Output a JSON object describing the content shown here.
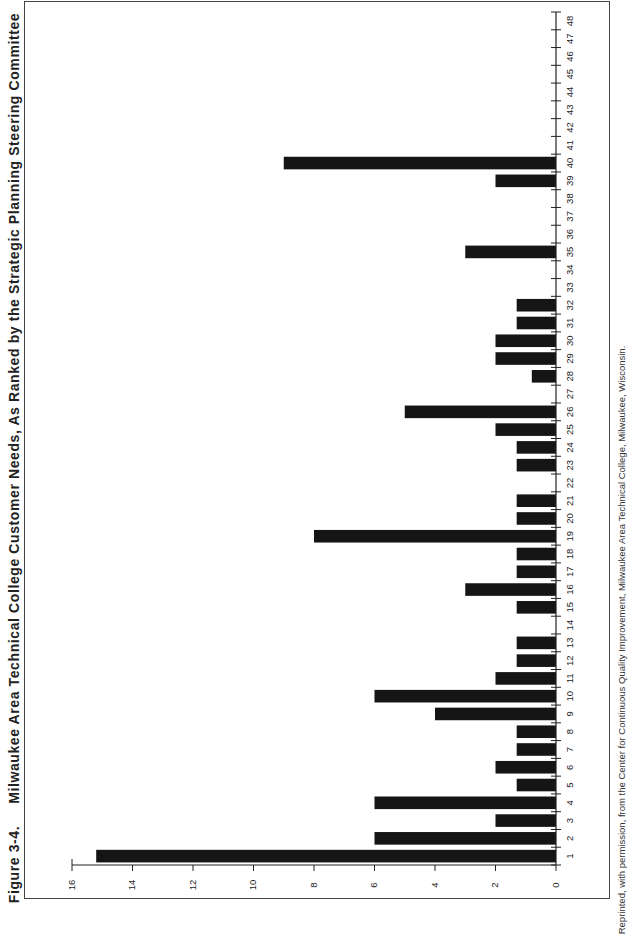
{
  "figure": {
    "label": "Figure 3-4.",
    "title": "Milwaukee Area Technical College Customer Needs, As Ranked by the Strategic Planning Steering Committee",
    "credit": "Reprinted, with permission, from the Center for Continuous Quality Improvement, Milwaukee Area Technical College, Milwaukee, Wisconsin."
  },
  "chart_data": {
    "type": "bar",
    "orientation": "horizontal-rotated page (bars extend from category axis)",
    "xlabel": "",
    "ylabel": "",
    "categories": [
      "1",
      "2",
      "3",
      "4",
      "5",
      "6",
      "7",
      "8",
      "9",
      "10",
      "11",
      "12",
      "13",
      "14",
      "15",
      "16",
      "17",
      "18",
      "19",
      "20",
      "21",
      "22",
      "23",
      "24",
      "25",
      "26",
      "27",
      "28",
      "29",
      "30",
      "31",
      "32",
      "33",
      "34",
      "35",
      "36",
      "37",
      "38",
      "39",
      "40",
      "41",
      "42",
      "43",
      "44",
      "45",
      "46",
      "47",
      "48"
    ],
    "values": [
      15.2,
      6,
      2,
      6,
      1.3,
      2,
      1.3,
      1.3,
      4,
      6,
      2,
      1.3,
      1.3,
      0,
      1.3,
      3,
      1.3,
      1.3,
      8,
      1.3,
      1.3,
      0,
      1.3,
      1.3,
      2,
      5,
      0,
      0.8,
      2,
      2,
      1.3,
      1.3,
      0,
      0,
      3,
      0,
      0,
      0,
      2,
      9,
      0,
      0,
      0,
      0,
      0,
      0,
      0,
      0
    ],
    "value_ticks": [
      0,
      2,
      4,
      6,
      8,
      10,
      12,
      14,
      16
    ],
    "ylim": [
      0,
      16
    ],
    "grid": false,
    "legend": null,
    "bar_color": "#151515"
  }
}
